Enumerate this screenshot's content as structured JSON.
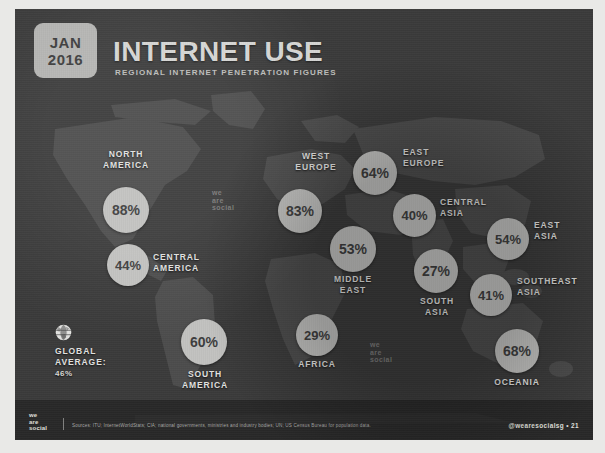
{
  "header": {
    "date_month": "JAN",
    "date_year": "2016",
    "title": "INTERNET USE",
    "subtitle": "REGIONAL INTERNET PENETRATION FIGURES"
  },
  "global_average": {
    "icon": "globe-icon",
    "label_line1": "GLOBAL",
    "label_line2": "AVERAGE:",
    "value": "46%"
  },
  "watermarks": [
    {
      "text": "we\nare\nsocial"
    },
    {
      "text": "we\nare\nsocial"
    }
  ],
  "footer": {
    "logo": "we\nare\nsocial",
    "source": "Sources: ITU; InternetWorldStats; CIA; national governments, ministries and industry bodies; UN; US Census Bureau for population data.",
    "handle": "@wearesocialsg  •  21"
  },
  "chart_data": {
    "type": "map",
    "title": "INTERNET USE",
    "subtitle": "REGIONAL INTERNET PENETRATION FIGURES",
    "unit": "percent of population",
    "global_average": 46,
    "categories": [
      "NORTH AMERICA",
      "CENTRAL AMERICA",
      "SOUTH AMERICA",
      "WEST EUROPE",
      "EAST EUROPE",
      "CENTRAL ASIA",
      "EAST ASIA",
      "MIDDLE EAST",
      "SOUTH ASIA",
      "SOUTHEAST ASIA",
      "AFRICA",
      "OCEANIA"
    ],
    "values": [
      88,
      44,
      60,
      83,
      64,
      40,
      54,
      53,
      27,
      41,
      29,
      68
    ],
    "regions": [
      {
        "name": "NORTH AMERICA",
        "label_lines": [
          "NORTH",
          "AMERICA"
        ],
        "value": 88,
        "value_label": "88%",
        "bx": 88,
        "by": 178,
        "bsize": 46,
        "fs": 14,
        "lx": 63,
        "ly": 140,
        "lw": 96,
        "align": "c"
      },
      {
        "name": "CENTRAL AMERICA",
        "label_lines": [
          "CENTRAL",
          "AMERICA"
        ],
        "value": 44,
        "value_label": "44%",
        "bx": 92,
        "by": 235,
        "bsize": 42,
        "fs": 13,
        "lx": 138,
        "ly": 243,
        "lw": 80,
        "align": "l"
      },
      {
        "name": "SOUTH AMERICA",
        "label_lines": [
          "SOUTH",
          "AMERICA"
        ],
        "value": 60,
        "value_label": "60%",
        "bx": 166,
        "by": 310,
        "bsize": 46,
        "fs": 14,
        "lx": 144,
        "ly": 360,
        "lw": 92,
        "align": "c"
      },
      {
        "name": "WEST EUROPE",
        "label_lines": [
          "WEST",
          "EUROPE"
        ],
        "value": 83,
        "value_label": "83%",
        "bx": 263,
        "by": 180,
        "bsize": 44,
        "fs": 14,
        "lx": 262,
        "ly": 142,
        "lw": 78,
        "align": "c"
      },
      {
        "name": "EAST EUROPE",
        "label_lines": [
          "EAST",
          "EUROPE"
        ],
        "value": 64,
        "value_label": "64%",
        "bx": 338,
        "by": 142,
        "bsize": 44,
        "fs": 14,
        "lx": 388,
        "ly": 138,
        "lw": 74,
        "align": "l"
      },
      {
        "name": "CENTRAL ASIA",
        "label_lines": [
          "CENTRAL",
          "ASIA"
        ],
        "value": 40,
        "value_label": "40%",
        "bx": 378,
        "by": 185,
        "bsize": 43,
        "fs": 13,
        "lx": 425,
        "ly": 188,
        "lw": 70,
        "align": "l"
      },
      {
        "name": "EAST ASIA",
        "label_lines": [
          "EAST",
          "ASIA"
        ],
        "value": 54,
        "value_label": "54%",
        "bx": 472,
        "by": 209,
        "bsize": 42,
        "fs": 13,
        "lx": 519,
        "ly": 211,
        "lw": 62,
        "align": "l"
      },
      {
        "name": "MIDDLE EAST",
        "label_lines": [
          "MIDDLE",
          "EAST"
        ],
        "value": 53,
        "value_label": "53%",
        "bx": 315,
        "by": 217,
        "bsize": 46,
        "fs": 14,
        "lx": 295,
        "ly": 265,
        "lw": 86,
        "align": "c"
      },
      {
        "name": "SOUTH ASIA",
        "label_lines": [
          "SOUTH",
          "ASIA"
        ],
        "value": 27,
        "value_label": "27%",
        "bx": 399,
        "by": 240,
        "bsize": 44,
        "fs": 14,
        "lx": 382,
        "ly": 287,
        "lw": 80,
        "align": "c"
      },
      {
        "name": "SOUTHEAST ASIA",
        "label_lines": [
          "SOUTHEAST",
          "ASIA"
        ],
        "value": 41,
        "value_label": "41%",
        "bx": 455,
        "by": 265,
        "bsize": 42,
        "fs": 13,
        "lx": 502,
        "ly": 267,
        "lw": 76,
        "align": "l"
      },
      {
        "name": "AFRICA",
        "label_lines": [
          "AFRICA"
        ],
        "value": 29,
        "value_label": "29%",
        "bx": 281,
        "by": 305,
        "bsize": 42,
        "fs": 13,
        "lx": 254,
        "ly": 350,
        "lw": 96,
        "align": "c"
      },
      {
        "name": "OCEANIA",
        "label_lines": [
          "OCEANIA"
        ],
        "value": 68,
        "value_label": "68%",
        "bx": 480,
        "by": 320,
        "bsize": 44,
        "fs": 14,
        "lx": 452,
        "ly": 368,
        "lw": 100,
        "align": "c"
      }
    ]
  }
}
